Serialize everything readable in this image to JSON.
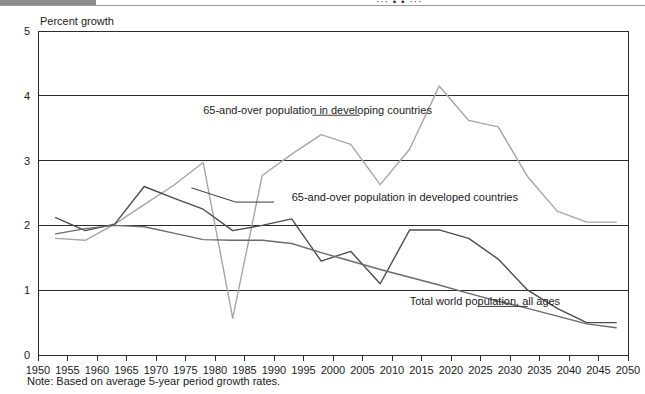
{
  "figure": {
    "y_axis_title": "Percent growth",
    "note": "Note: Based on average 5-year period growth rates.",
    "top_partial_text": "··· ▪ ▪ ···"
  },
  "chart_data": {
    "type": "line",
    "title": "",
    "subtitle": "",
    "xlabel": "",
    "ylabel": "Percent growth",
    "xlim": [
      1950,
      2050
    ],
    "ylim": [
      0,
      5
    ],
    "xticks": [
      1950,
      1955,
      1960,
      1965,
      1970,
      1975,
      1980,
      1985,
      1990,
      1995,
      2000,
      2005,
      2010,
      2015,
      2020,
      2025,
      2030,
      2035,
      2040,
      2045,
      2050
    ],
    "yticks": [
      0,
      1,
      2,
      3,
      4,
      5
    ],
    "grid": "horizontal",
    "legend": "annotations-inline",
    "note": "Based on average 5-year period growth rates.",
    "x": [
      1953,
      1958,
      1963,
      1968,
      1973,
      1978,
      1983,
      1988,
      1993,
      1998,
      2003,
      2008,
      2013,
      2018,
      2023,
      2028,
      2033,
      2038,
      2043,
      2048
    ],
    "series": [
      {
        "name": "65-and-over population in developing countries",
        "color": "#a6a6a6",
        "values": [
          1.8,
          1.77,
          2.02,
          2.32,
          2.62,
          2.97,
          0.57,
          2.77,
          3.1,
          3.4,
          3.25,
          2.63,
          3.18,
          4.15,
          3.62,
          3.52,
          2.75,
          2.22,
          2.05,
          2.05
        ]
      },
      {
        "name": "65-and-over population in developed countries",
        "color": "#4d4d4d",
        "values": [
          2.12,
          1.92,
          2.02,
          2.6,
          2.42,
          2.25,
          1.92,
          2.0,
          2.1,
          1.45,
          1.6,
          1.1,
          1.93,
          1.93,
          1.8,
          1.48,
          1.0,
          0.72,
          0.5,
          0.5
        ]
      },
      {
        "name": "Total world population, all ages",
        "color": "#6b6b6b",
        "values": [
          1.87,
          1.95,
          2.0,
          1.98,
          1.88,
          1.78,
          1.77,
          1.77,
          1.72,
          1.58,
          1.45,
          1.32,
          1.2,
          1.08,
          0.95,
          0.83,
          0.72,
          0.6,
          0.48,
          0.42
        ]
      }
    ],
    "annotations": [
      {
        "text": "65-and-over population in developing countries",
        "x": 1978,
        "y": 3.72
      },
      {
        "text": "65-and-over population in developed countries",
        "x": 1993,
        "y": 2.38
      },
      {
        "text": "Total world population, all ages",
        "x": 2013,
        "y": 0.77
      }
    ]
  }
}
